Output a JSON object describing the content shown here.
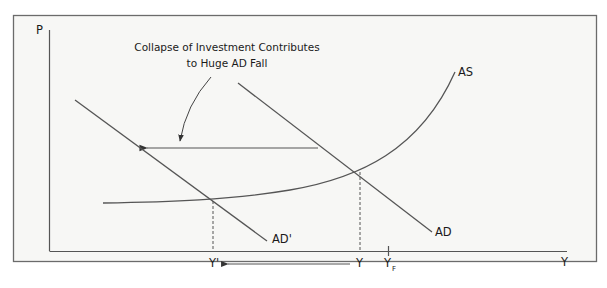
{
  "diagram": {
    "title_note_lines": [
      "Collapse of Investment Contributes",
      "to Huge AD Fall"
    ],
    "axes": {
      "y_label": "P",
      "x_label": "Y"
    },
    "curves": {
      "as_label": "AS",
      "ad_label": "AD",
      "ad_prime_label": "AD'"
    },
    "x_ticks": {
      "y_prime": "Y'",
      "y": "Y",
      "y_full": "Y",
      "y_full_subscript": "F"
    },
    "colors": {
      "background": "#f7f7f5",
      "frame": "#6b6b6b",
      "line": "#555555",
      "text": "#1a1a1a"
    }
  }
}
